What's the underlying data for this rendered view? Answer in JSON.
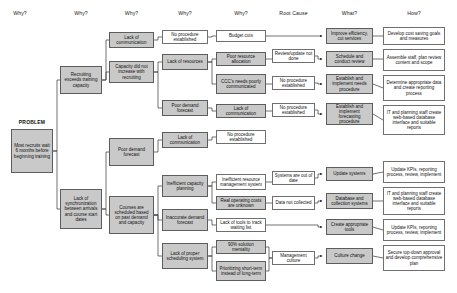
{
  "diagram": {
    "title_label": "PROBLEM",
    "headers": [
      {
        "label": "Why?",
        "x": 14,
        "y": 10
      },
      {
        "label": "Why?",
        "x": 76,
        "y": 10
      },
      {
        "label": "Why?",
        "x": 138,
        "y": 10
      },
      {
        "label": "Why?",
        "x": 192,
        "y": 10
      },
      {
        "label": "Why?",
        "x": 248,
        "y": 10
      },
      {
        "label": "Root Cause",
        "x": 296,
        "y": 10
      },
      {
        "label": "What?",
        "x": 352,
        "y": 10
      },
      {
        "label": "How?",
        "x": 418,
        "y": 10
      }
    ],
    "problem": {
      "label": "PROBLEM",
      "text": "Most recruits wait 6 months before beginning training"
    },
    "nodes": [
      {
        "id": "problem",
        "text": "Most recruits wait 6 months before beginning training",
        "style": "problem",
        "x": 11,
        "y": 129,
        "w": 42,
        "h": 44
      },
      {
        "id": "why1a",
        "text": "Recruiting exceeds training capacity",
        "style": "gray",
        "x": 60,
        "y": 66,
        "w": 42,
        "h": 28
      },
      {
        "id": "why1b",
        "text": "Lack of synchronization between arrivals and course start dates",
        "style": "gray",
        "x": 60,
        "y": 189,
        "w": 42,
        "h": 40
      },
      {
        "id": "why2a",
        "text": "Lack of communication",
        "style": "gray",
        "x": 109,
        "y": 32,
        "w": 45,
        "h": 16
      },
      {
        "id": "why2b",
        "text": "Capacity did not increase with recruiting",
        "style": "gray",
        "x": 109,
        "y": 61,
        "w": 45,
        "h": 22
      },
      {
        "id": "why2c",
        "text": "Poor demand forecast",
        "style": "gray",
        "x": 109,
        "y": 138,
        "w": 45,
        "h": 28
      },
      {
        "id": "why2d",
        "text": "Courses are scheduled based on past demand and capacity",
        "style": "gray",
        "x": 109,
        "y": 196,
        "w": 45,
        "h": 38
      },
      {
        "id": "why3a",
        "text": "No procedure established",
        "style": "white",
        "x": 162,
        "y": 30,
        "w": 46,
        "h": 14
      },
      {
        "id": "why3b",
        "text": "Lack of resources",
        "style": "gray",
        "x": 162,
        "y": 54,
        "w": 46,
        "h": 16
      },
      {
        "id": "why3c",
        "text": "Poor demand forecast",
        "style": "gray",
        "x": 162,
        "y": 100,
        "w": 46,
        "h": 16
      },
      {
        "id": "why3d",
        "text": "Lack of communication",
        "style": "gray",
        "x": 162,
        "y": 132,
        "w": 46,
        "h": 16
      },
      {
        "id": "why3e",
        "text": "Inefficient capacity planning",
        "style": "gray",
        "x": 162,
        "y": 175,
        "w": 46,
        "h": 22
      },
      {
        "id": "why3f",
        "text": "Inaccurate demand forecast",
        "style": "gray",
        "x": 162,
        "y": 209,
        "w": 46,
        "h": 22
      },
      {
        "id": "why3g",
        "text": "Lack of proper scheduling system",
        "style": "gray",
        "x": 162,
        "y": 243,
        "w": 46,
        "h": 26
      },
      {
        "id": "why4a",
        "text": "Budget cuts",
        "style": "white",
        "x": 216,
        "y": 30,
        "w": 50,
        "h": 12
      },
      {
        "id": "why4b",
        "text": "Poor resource allocation",
        "style": "gray",
        "x": 216,
        "y": 52,
        "w": 50,
        "h": 14
      },
      {
        "id": "why4c",
        "text": "CCC's needs poorly communicated",
        "style": "gray",
        "x": 216,
        "y": 74,
        "w": 50,
        "h": 20
      },
      {
        "id": "why4d",
        "text": "Lack of communication",
        "style": "gray",
        "x": 216,
        "y": 104,
        "w": 50,
        "h": 14
      },
      {
        "id": "why4e",
        "text": "No procedure established",
        "style": "white",
        "x": 216,
        "y": 130,
        "w": 50,
        "h": 14
      },
      {
        "id": "why4f",
        "text": "Inefficient resource management system",
        "style": "white",
        "x": 216,
        "y": 174,
        "w": 50,
        "h": 16
      },
      {
        "id": "why4g",
        "text": "Real operating costs are unknown",
        "style": "gray",
        "x": 216,
        "y": 196,
        "w": 50,
        "h": 14
      },
      {
        "id": "why4h",
        "text": "Lack of tools to track waiting list",
        "style": "white",
        "x": 216,
        "y": 218,
        "w": 50,
        "h": 14
      },
      {
        "id": "why4i",
        "text": "90% solution mentality",
        "style": "gray",
        "x": 216,
        "y": 240,
        "w": 50,
        "h": 14
      },
      {
        "id": "why4j",
        "text": "Prioritizing short-term instead of long-term",
        "style": "gray",
        "x": 216,
        "y": 261,
        "w": 50,
        "h": 20
      },
      {
        "id": "rc1",
        "text": "Review/update not done",
        "style": "white",
        "x": 272,
        "y": 49,
        "w": 43,
        "h": 14
      },
      {
        "id": "rc2",
        "text": "No procedure established",
        "style": "white",
        "x": 272,
        "y": 76,
        "w": 43,
        "h": 14
      },
      {
        "id": "rc3",
        "text": "No procedure established",
        "style": "white",
        "x": 272,
        "y": 103,
        "w": 43,
        "h": 14
      },
      {
        "id": "rc4",
        "text": "Systems are out of date",
        "style": "white",
        "x": 272,
        "y": 171,
        "w": 43,
        "h": 14
      },
      {
        "id": "rc5",
        "text": "Data not collected",
        "style": "white",
        "x": 272,
        "y": 196,
        "w": 43,
        "h": 14
      },
      {
        "id": "rc6",
        "text": "Management culture",
        "style": "white",
        "x": 272,
        "y": 251,
        "w": 43,
        "h": 14
      },
      {
        "id": "what1",
        "text": "Improve efficiency, cut services",
        "style": "gray",
        "x": 326,
        "y": 28,
        "w": 47,
        "h": 16
      },
      {
        "id": "what2",
        "text": "Schedule and conduct review",
        "style": "gray",
        "x": 326,
        "y": 51,
        "w": 47,
        "h": 16
      },
      {
        "id": "what3",
        "text": "Establish and implement needs procedure",
        "style": "gray",
        "x": 326,
        "y": 74,
        "w": 47,
        "h": 20
      },
      {
        "id": "what4",
        "text": "Establish and implement forecasting procedure",
        "style": "gray",
        "x": 326,
        "y": 103,
        "w": 47,
        "h": 22
      },
      {
        "id": "what5",
        "text": "Update systems",
        "style": "gray",
        "x": 326,
        "y": 167,
        "w": 47,
        "h": 14
      },
      {
        "id": "what6",
        "text": "Database and collection systems",
        "style": "gray",
        "x": 326,
        "y": 193,
        "w": 47,
        "h": 16
      },
      {
        "id": "what7",
        "text": "Create appropriate tools",
        "style": "gray",
        "x": 326,
        "y": 219,
        "w": 47,
        "h": 16
      },
      {
        "id": "what8",
        "text": "Culture change",
        "style": "gray",
        "x": 326,
        "y": 248,
        "w": 47,
        "h": 16
      },
      {
        "id": "how1",
        "text": "Develop cost saving goals and measures",
        "style": "white",
        "x": 383,
        "y": 27,
        "w": 62,
        "h": 18
      },
      {
        "id": "how2",
        "text": "Assemble staff, plan review content and scope",
        "style": "white",
        "x": 383,
        "y": 49,
        "w": 62,
        "h": 22
      },
      {
        "id": "how3",
        "text": "Determine appropriate data and create reporting process",
        "style": "white",
        "x": 383,
        "y": 75,
        "w": 62,
        "h": 26
      },
      {
        "id": "how4",
        "text": "IT and planning staff create web-based database interface and suitable reports",
        "style": "white",
        "x": 383,
        "y": 105,
        "w": 62,
        "h": 30
      },
      {
        "id": "how5",
        "text": "Update KPIs, reporting process, review, implement",
        "style": "white",
        "x": 383,
        "y": 161,
        "w": 62,
        "h": 22
      },
      {
        "id": "how6",
        "text": "IT and planning staff create web-based database interface and suitable reports",
        "style": "white",
        "x": 383,
        "y": 187,
        "w": 62,
        "h": 28
      },
      {
        "id": "how7",
        "text": "Update KPIs, reporting process, review, implement",
        "style": "white",
        "x": 383,
        "y": 219,
        "w": 62,
        "h": 22
      },
      {
        "id": "how8",
        "text": "Secure top-down approval and develop comprehensive plan",
        "style": "white",
        "x": 383,
        "y": 245,
        "w": 62,
        "h": 26
      }
    ],
    "colors": {
      "box_fill_gray": "#c9c9c9",
      "box_fill_white": "#ffffff",
      "border": "#6f6f6f",
      "connector": "#333333",
      "text": "#111111",
      "background": "#ffffff"
    },
    "connectors": [
      "problem-why1a",
      "problem-why1b",
      "why1a-why2a",
      "why1a-why2b",
      "why1b-why2c",
      "why1b-why2d",
      "why2a-why3a",
      "why2b-why3b",
      "why2b-why3c",
      "why2c-why3d",
      "why2d-why3e",
      "why2d-why3f",
      "why2d-why3g",
      "why3a-why4a",
      "why3b-why4b",
      "why3b-why4c",
      "why3c-why4d",
      "why3d-why4e",
      "why3e-why4f",
      "why3e-why4g",
      "why3f-why4h",
      "why3g-why4i",
      "why3g-why4j",
      "why4a-what1",
      "why4b-rc1",
      "why4c-rc2",
      "why4d-rc3",
      "why4f-rc4",
      "why4g-rc5",
      "why4h-what7",
      "why4i-rc6",
      "why4j-rc6",
      "rc1-what2",
      "rc2-what3",
      "rc3-what4",
      "rc4-what5",
      "rc5-what6",
      "rc6-what8",
      "what1-how1",
      "what2-how2",
      "what3-how3",
      "what4-how4",
      "what5-how5",
      "what6-how6",
      "what7-how7",
      "what8-how8"
    ]
  }
}
